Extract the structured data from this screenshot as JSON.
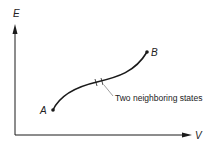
{
  "diagram": {
    "axes": {
      "y_label": "E",
      "x_label": "V"
    },
    "points": {
      "start_label": "A",
      "end_label": "B"
    },
    "annotation": "Two neighboring states",
    "colors": {
      "ink": "#1a1a1a",
      "leader": "#777777"
    }
  }
}
